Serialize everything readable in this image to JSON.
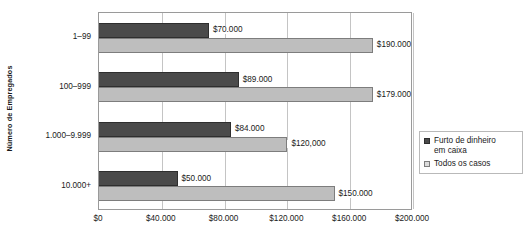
{
  "chart_data": {
    "type": "bar",
    "orientation": "horizontal",
    "title": "",
    "subtitle": "",
    "xlabel": "",
    "ylabel": "Número de Empregados",
    "xlim": [
      0,
      200000
    ],
    "grid": true,
    "grid_axis": "x",
    "legend_position": "right",
    "categories": [
      "1–99",
      "100–999",
      "1.000–9.999",
      "10.000+"
    ],
    "x_tick_values": [
      0,
      40000,
      80000,
      120000,
      160000,
      200000
    ],
    "x_tick_labels": [
      "$0",
      "$40.000",
      "$80.000",
      "$120.000",
      "$160.000",
      "$200.000"
    ],
    "series": [
      {
        "name": "Furto de dinheiro em caixa",
        "color": "#4a4a4a",
        "values": [
          70000,
          89000,
          84000,
          50000
        ],
        "value_labels": [
          "$70.000",
          "$89.000",
          "$84.000",
          "$50.000"
        ]
      },
      {
        "name": "Todos os casos",
        "color": "#bebebe",
        "values": [
          190000,
          179000,
          120000,
          150000
        ],
        "value_labels": [
          "$190.000",
          "$179.000",
          "$120,000",
          "$150.000"
        ]
      }
    ]
  },
  "legend": {
    "entries": [
      {
        "label_line1": "Furto de dinheiro",
        "label_line2": "em caixa"
      },
      {
        "label_line1": "Todos os casos",
        "label_line2": ""
      }
    ]
  }
}
